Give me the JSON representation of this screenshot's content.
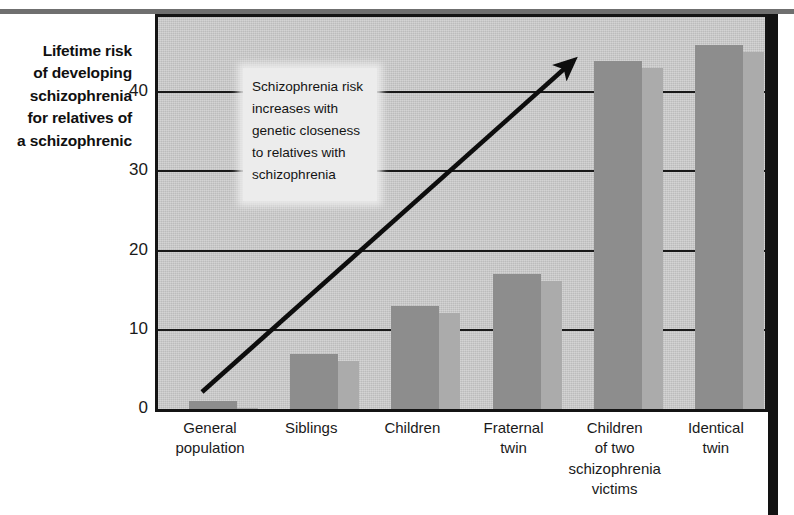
{
  "y_axis_caption": {
    "lines": [
      "Lifetime risk",
      "of developing",
      "schizophrenia",
      "for relatives of",
      "a schizophrenic"
    ]
  },
  "annotation": {
    "lines": [
      "Schizophrenia risk",
      "increases with",
      "genetic closeness",
      "to relatives with",
      "schizophrenia"
    ]
  },
  "arrow": {
    "name": "trend-arrow",
    "direction": "up-right"
  },
  "colors": {
    "plot_background": "#c9c9c9",
    "bar_main": "#8d8d8d",
    "bar_shadow": "#ababab",
    "axis": "#141414",
    "callout_background": "#ececec",
    "top_band": "#6f6f6f",
    "right_rule": "#121212"
  },
  "chart_data": {
    "type": "bar",
    "title": "",
    "xlabel": "",
    "ylabel": "Lifetime risk of developing schizophrenia for relatives of a schizophrenic",
    "ylim": [
      0,
      49.5
    ],
    "yticks": [
      0,
      10,
      20,
      30,
      40
    ],
    "ytick_labels": [
      "0",
      "10",
      "20",
      "30",
      "40"
    ],
    "grid": true,
    "legend": null,
    "categories": [
      "General population",
      "Siblings",
      "Children",
      "Fraternal twin",
      "Children of two schizophrenia victims",
      "Identical twin"
    ],
    "category_label_lines": [
      [
        "General",
        "population"
      ],
      [
        "Siblings"
      ],
      [
        "Children"
      ],
      [
        "Fraternal",
        "twin"
      ],
      [
        "Children",
        "of two",
        "schizophrenia",
        "victims"
      ],
      [
        "Identical",
        "twin"
      ]
    ],
    "values": [
      1,
      7,
      13,
      17,
      44,
      46
    ],
    "annotation_text": "Schizophrenia risk increases with genetic closeness to relatives with schizophrenia"
  }
}
